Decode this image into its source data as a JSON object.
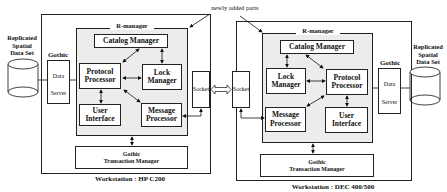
{
  "annotation": "newly added parts",
  "left": {
    "workstation_label": "Workstation : HP C200",
    "dataset_label": "Replicated\nSpatial\nData Set",
    "gothic_label": "Gothic",
    "data_server": {
      "line1": "Data",
      "line2": "Server"
    },
    "rmanager_label": "R-manager",
    "catalog_manager": "Catalog Manager",
    "protocol_processor": "Protocol\nProcessor",
    "lock_manager": "Lock\nManager",
    "user_interface": "User\nInterface",
    "message_processor": "Message\nProcessor",
    "transaction_manager": "Gothic\nTransaction Manager",
    "socket": "Socket"
  },
  "right": {
    "workstation_label": "Workstation : DEC 400/500",
    "dataset_label": "Replicated\nSpatial\nData Set",
    "gothic_label": "Gothic",
    "data_server": {
      "line1": "Data",
      "line2": "Server"
    },
    "rmanager_label": "R-manager",
    "catalog_manager": "Catalog Manager",
    "protocol_processor": "Protocol\nProcessor",
    "lock_manager": "Lock\nManager",
    "user_interface": "User\nInterface",
    "message_processor": "Message\nProcessor",
    "transaction_manager": "Gothic\nTransaction Manager",
    "socket": "Socket"
  }
}
